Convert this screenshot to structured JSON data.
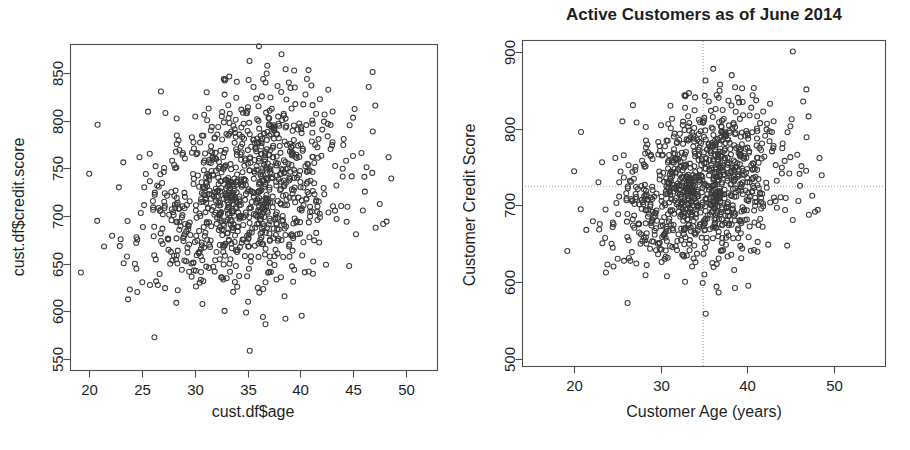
{
  "page": {
    "background_color": "#ffffff",
    "width": 910,
    "height": 450,
    "panel_count": 2
  },
  "chart_data": [
    {
      "id": "left-default-plot",
      "type": "scatter",
      "title": "",
      "xlabel": "cust.df$age",
      "ylabel": "cust.df$credit.score",
      "xlim": [
        18.2,
        53.0
      ],
      "ylim": [
        538,
        880
      ],
      "xticks": [
        20,
        25,
        30,
        35,
        40,
        45,
        50
      ],
      "yticks": [
        550,
        600,
        650,
        700,
        750,
        800,
        850
      ],
      "grid": false,
      "legend": "none",
      "marker": "open-circle",
      "marker_color": "#3a3a3a",
      "n_points": 1000,
      "x_mean": 34.9,
      "x_sd": 5.0,
      "y_mean": 725,
      "y_sd": 52,
      "correlation": 0.25,
      "notes": "Default R plot of credit score against customer age; axis labels are raw data-frame expressions."
    },
    {
      "id": "right-annotated-plot",
      "type": "scatter",
      "title": "Active Customers as of June 2014",
      "xlabel": "Customer Age (years)",
      "ylabel": "Customer Credit Score",
      "xlim": [
        14.0,
        56.0
      ],
      "ylim": [
        490,
        915
      ],
      "xticks": [
        20,
        30,
        40,
        50
      ],
      "yticks": [
        500,
        600,
        700,
        800,
        900
      ],
      "grid": false,
      "legend": "none",
      "marker": "open-circle",
      "marker_color": "#3a3a3a",
      "n_points": 1000,
      "x_mean": 34.9,
      "x_sd": 5.0,
      "y_mean": 725,
      "y_sd": 52,
      "correlation": 0.25,
      "reference_lines": {
        "vertical_x": 34.9,
        "horizontal_y": 725,
        "style": "dotted",
        "color": "#9a9a9a"
      },
      "notes": "Same data re-plotted with readable axis labels, a title, and dotted mean reference lines."
    }
  ],
  "left_panel": {
    "x_axis": {
      "title": "cust.df$age",
      "tick_labels": [
        "20",
        "25",
        "30",
        "35",
        "40",
        "45",
        "50"
      ]
    },
    "y_axis": {
      "title": "cust.df$credit.score",
      "tick_labels": [
        "550",
        "600",
        "650",
        "700",
        "750",
        "800",
        "850"
      ]
    }
  },
  "right_panel": {
    "title": "Active Customers as of June 2014",
    "x_axis": {
      "title": "Customer Age (years)",
      "tick_labels": [
        "20",
        "30",
        "40",
        "50"
      ]
    },
    "y_axis": {
      "title": "Customer Credit Score",
      "tick_labels": [
        "500",
        "600",
        "700",
        "800",
        "900"
      ]
    }
  }
}
